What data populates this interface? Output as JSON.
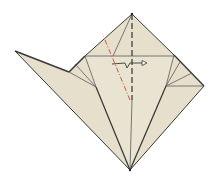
{
  "diagram": {
    "type": "origami-fold-step",
    "caption": "",
    "colors": {
      "paper": "#e6dfcc",
      "paper_shade": "#ddd5bf",
      "edge": "#3a3a3a",
      "crease": "#6a6a6a",
      "valley_fold": "#d9533a",
      "mountain_fold": "#4a4a4a",
      "arrow": "#3a3a3a"
    },
    "symbols": [
      {
        "name": "mountain-fold-line",
        "style": "dashed",
        "from": [
          132,
          14
        ],
        "to": [
          132,
          100
        ]
      },
      {
        "name": "valley-fold-line",
        "style": "dash-dot",
        "color": "red",
        "from": [
          105,
          40
        ],
        "to": [
          130,
          100
        ]
      },
      {
        "name": "fold-over-arrow",
        "from": [
          112,
          65
        ],
        "to": [
          146,
          62
        ]
      }
    ]
  }
}
